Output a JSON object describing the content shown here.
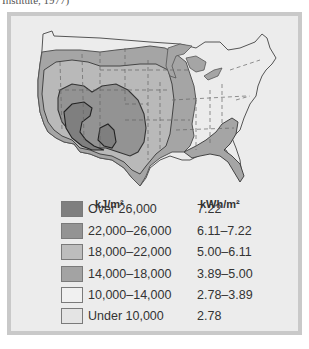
{
  "caption": "Institute, 1977)",
  "map": {
    "subject": "Average annual solar radiation, contiguous United States",
    "zone_colors": {
      "over_26000": "#7f7f7f",
      "z22_26": "#939393",
      "z18_22": "#b9b9b9",
      "z14_18": "#a5a5a5",
      "z10_14": "#ececec",
      "under_10000": "#e2e2e2"
    }
  },
  "legend": {
    "header_kj": "kJ/m²",
    "header_kwh": "kWh/m²",
    "rows": [
      {
        "label": "Over 26,000",
        "value": "7.22",
        "color": "#7f7f7f"
      },
      {
        "label": "22,000–26,000",
        "value": "6.11–7.22",
        "color": "#939393"
      },
      {
        "label": "18,000–22,000",
        "value": "5.00–6.11",
        "color": "#bdbdbd"
      },
      {
        "label": "14,000–18,000",
        "value": "3.89–5.00",
        "color": "#a3a3a3"
      },
      {
        "label": "10,000–14,000",
        "value": "2.78–3.89",
        "color": "#f0f0f0"
      },
      {
        "label": "Under 10,000",
        "value": "2.78",
        "color": "#e4e4e4"
      }
    ]
  }
}
